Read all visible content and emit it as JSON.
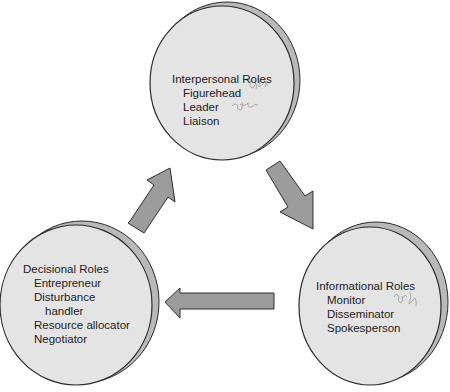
{
  "diagram": {
    "type": "cycle",
    "colors": {
      "disc_face": "#e4e4e4",
      "disc_rim": "#b9b9b9",
      "disc_outline": "#2a2a2a",
      "arrow_fill": "#9c9c9c",
      "arrow_outline": "#2e2e2e",
      "text": "#1c1c1c",
      "annotation": "#8a8a8a"
    },
    "nodes": [
      {
        "id": "interpersonal",
        "title": "Interpersonal Roles",
        "items": [
          "Figurehead",
          "Leader",
          "Liaison"
        ]
      },
      {
        "id": "informational",
        "title": "Informational Roles",
        "items": [
          "Monitor",
          "Disseminator",
          "Spokesperson"
        ]
      },
      {
        "id": "decisional",
        "title": "Decisional Roles",
        "items": [
          "Entrepreneur",
          "Disturbance",
          "handler",
          "Resource allocator",
          "Negotiator"
        ]
      }
    ],
    "arrows": [
      {
        "from": "interpersonal",
        "to": "informational",
        "direction": "down-right"
      },
      {
        "from": "informational",
        "to": "decisional",
        "direction": "left"
      },
      {
        "from": "decisional",
        "to": "interpersonal",
        "direction": "up-right"
      }
    ]
  }
}
